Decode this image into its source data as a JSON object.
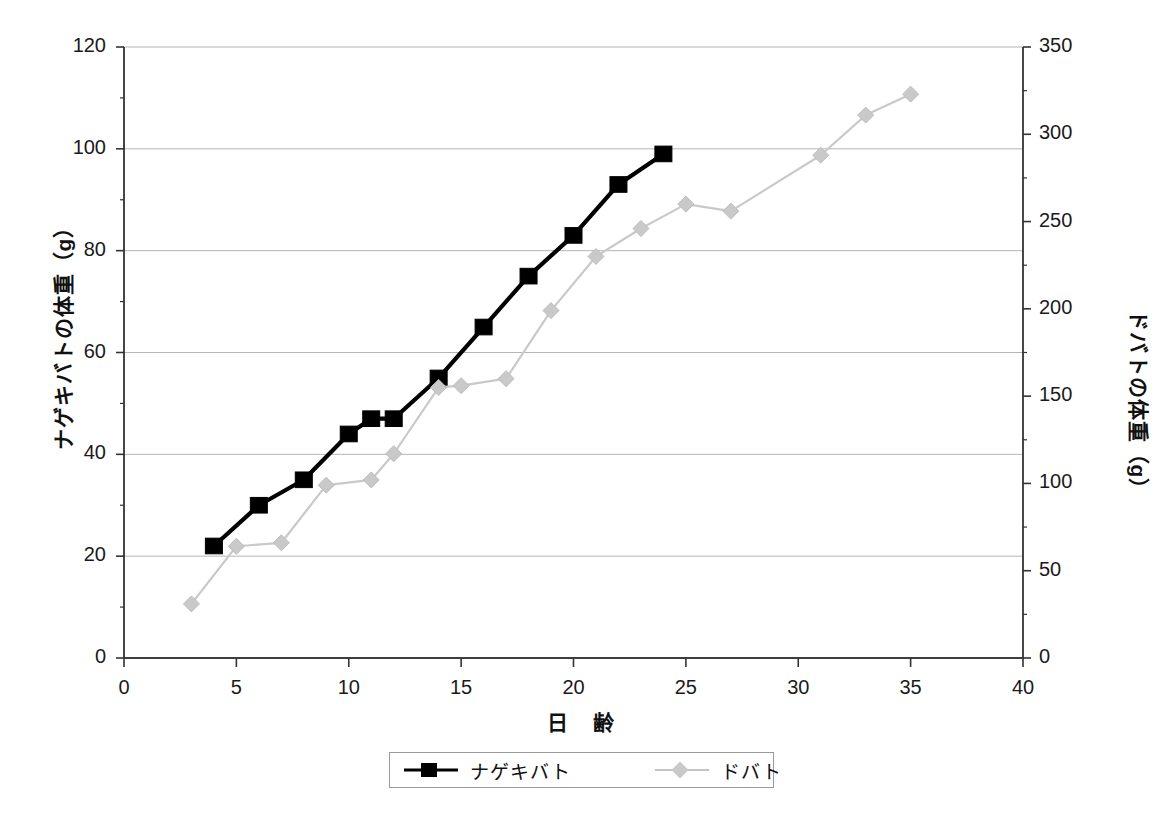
{
  "chart_data": {
    "type": "line",
    "title": "",
    "xlabel": "日　齢",
    "ylabel": "ナゲキバトの体重（g）",
    "y2label": "ドバトの体重（g）",
    "xlim": [
      0,
      40
    ],
    "xticks": [
      0,
      5,
      10,
      15,
      20,
      25,
      30,
      35,
      40
    ],
    "ylim": [
      0,
      120
    ],
    "yticks": [
      0,
      20,
      40,
      60,
      80,
      100,
      120
    ],
    "y2lim": [
      0,
      350
    ],
    "y2ticks": [
      0,
      50,
      100,
      150,
      200,
      250,
      300,
      350
    ],
    "grid": "horizontal",
    "legend_position": "bottom",
    "series": [
      {
        "name": "ナゲキバト",
        "axis": "left",
        "marker": "square",
        "color": "#000000",
        "points": [
          {
            "x": 4,
            "y": 22
          },
          {
            "x": 6,
            "y": 30
          },
          {
            "x": 8,
            "y": 35
          },
          {
            "x": 10,
            "y": 44
          },
          {
            "x": 11,
            "y": 47
          },
          {
            "x": 12,
            "y": 47
          },
          {
            "x": 14,
            "y": 55
          },
          {
            "x": 16,
            "y": 65
          },
          {
            "x": 18,
            "y": 75
          },
          {
            "x": 20,
            "y": 83
          },
          {
            "x": 22,
            "y": 93
          },
          {
            "x": 24,
            "y": 99
          }
        ]
      },
      {
        "name": "ドバト",
        "axis": "right",
        "marker": "diamond",
        "color": "#c9c9c9",
        "points": [
          {
            "x": 3,
            "y": 31
          },
          {
            "x": 5,
            "y": 64
          },
          {
            "x": 7,
            "y": 66
          },
          {
            "x": 9,
            "y": 99
          },
          {
            "x": 11,
            "y": 102
          },
          {
            "x": 12,
            "y": 117
          },
          {
            "x": 14,
            "y": 155
          },
          {
            "x": 15,
            "y": 156
          },
          {
            "x": 17,
            "y": 160
          },
          {
            "x": 19,
            "y": 199
          },
          {
            "x": 21,
            "y": 230
          },
          {
            "x": 23,
            "y": 246
          },
          {
            "x": 25,
            "y": 260
          },
          {
            "x": 27,
            "y": 256
          },
          {
            "x": 31,
            "y": 288
          },
          {
            "x": 33,
            "y": 311
          },
          {
            "x": 35,
            "y": 323
          }
        ]
      }
    ]
  },
  "legend": {
    "items": [
      {
        "label": "ナゲキバト"
      },
      {
        "label": "ドバト"
      }
    ]
  },
  "axes": {
    "x_tick_labels": [
      "0",
      "5",
      "10",
      "15",
      "20",
      "25",
      "30",
      "35",
      "40"
    ],
    "y_left_tick_labels": [
      "0",
      "20",
      "40",
      "60",
      "80",
      "100",
      "120"
    ],
    "y_right_tick_labels": [
      "0",
      "50",
      "100",
      "150",
      "200",
      "250",
      "300",
      "350"
    ],
    "x_title": "日　齢",
    "y_left_title": "ナゲキバトの体重（g）",
    "y_right_title": "ドバトの体重（g）"
  },
  "colors": {
    "series_primary": "#000000",
    "series_secondary": "#c9c9c9",
    "axis": "#333333",
    "grid": "#b5b5b5",
    "background": "#ffffff"
  }
}
